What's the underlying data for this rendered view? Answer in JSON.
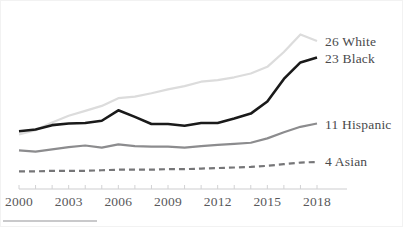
{
  "chart_data": {
    "type": "line",
    "title": "",
    "subtitle": "",
    "xlabel": "",
    "ylabel": "",
    "grid": false,
    "legend_position": "right-inline-end-labels",
    "x": [
      2000,
      2001,
      2002,
      2003,
      2004,
      2005,
      2006,
      2007,
      2008,
      2009,
      2010,
      2011,
      2012,
      2013,
      2014,
      2015,
      2016,
      2017,
      2018
    ],
    "xtick_labels": [
      "2000",
      "2003",
      "2006",
      "2009",
      "2012",
      "2015",
      "2018"
    ],
    "xticks": [
      2000,
      2003,
      2006,
      2009,
      2012,
      2015,
      2018
    ],
    "xlim": [
      2000,
      2018
    ],
    "ylim": [
      0,
      30
    ],
    "series": [
      {
        "name": "White",
        "end_label": "26 White",
        "end_value": 26,
        "color": "#dcdcdc",
        "style": "solid",
        "values": [
          9.0,
          9.8,
          11.2,
          12.4,
          13.3,
          14.2,
          15.6,
          15.9,
          16.5,
          17.2,
          17.8,
          18.6,
          18.9,
          19.4,
          20.1,
          21.3,
          24.0,
          27.2,
          26.0
        ]
      },
      {
        "name": "Black",
        "end_label": "23 Black",
        "end_value": 23,
        "color": "#1a1a1a",
        "style": "solid",
        "values": [
          9.6,
          9.9,
          10.7,
          11.0,
          11.1,
          11.5,
          13.4,
          12.2,
          10.9,
          10.9,
          10.6,
          11.1,
          11.1,
          11.9,
          12.8,
          15.0,
          19.1,
          22.1,
          23.0
        ]
      },
      {
        "name": "Hispanic",
        "end_label": "11 Hispanic",
        "end_value": 11,
        "color": "#8c8c8e",
        "style": "solid",
        "values": [
          6.1,
          5.9,
          6.3,
          6.7,
          7.0,
          6.6,
          7.2,
          6.9,
          6.8,
          6.8,
          6.6,
          6.9,
          7.1,
          7.3,
          7.5,
          8.3,
          9.4,
          10.4,
          11.0
        ]
      },
      {
        "name": "Asian",
        "end_label": "4 Asian",
        "end_value": 4,
        "color": "#767678",
        "style": "dashed",
        "values": [
          2.3,
          2.3,
          2.4,
          2.4,
          2.4,
          2.5,
          2.6,
          2.6,
          2.6,
          2.7,
          2.7,
          2.8,
          2.9,
          3.0,
          3.1,
          3.3,
          3.6,
          3.9,
          4.0
        ]
      }
    ]
  },
  "axis": {
    "tick_color": "#d2d2d4",
    "line_color": "#cdcdcf",
    "minor_tick_years": [
      2000,
      2001,
      2002,
      2003,
      2004,
      2005,
      2006,
      2007,
      2008,
      2009,
      2010,
      2011,
      2012,
      2013,
      2014,
      2015,
      2016,
      2017,
      2018
    ]
  },
  "frame": {
    "border_color": "#f2f2f2",
    "background": "#ffffff",
    "bottom_rule_color": "#c9c9cb"
  }
}
